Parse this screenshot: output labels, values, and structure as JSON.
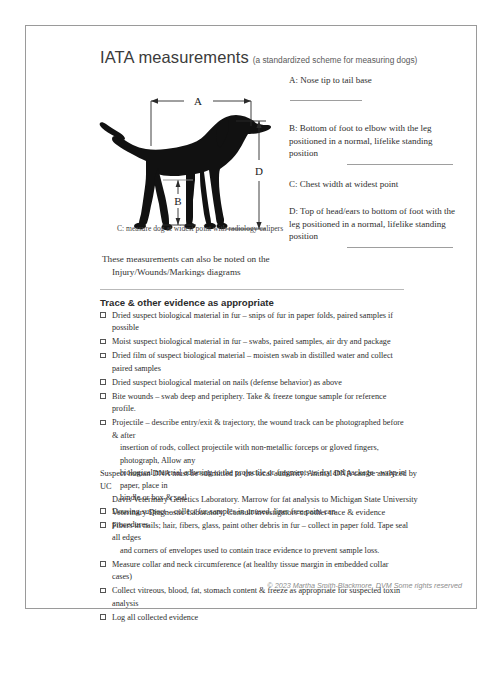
{
  "header": {
    "title": "IATA measurements",
    "subtitle": "(a standardized scheme for measuring dogs)"
  },
  "diagram": {
    "label_a": "A",
    "label_b": "B",
    "label_d": "D",
    "caption": "C: measure dog at widest point with radiology calipers",
    "note_line1": "These measurements can also be noted on the",
    "note_line2": "Injury/Wounds/Markings diagrams"
  },
  "measurements": [
    {
      "id": "A",
      "text": "A: Nose tip to tail base",
      "rule": "inline"
    },
    {
      "id": "B",
      "text": "B: Bottom of foot to elbow with the leg positioned in a normal, lifelike standing position",
      "rule": "below"
    },
    {
      "id": "C",
      "text": "C:  Chest width at widest point",
      "rule": "none"
    },
    {
      "id": "D",
      "text": "D: Top of head/ears to bottom of foot with the leg positioned in a normal, lifelike standing position",
      "rule": "below"
    }
  ],
  "trace": {
    "heading": "Trace & other evidence as appropriate",
    "items": [
      {
        "lines": [
          "Dried suspect biological material in fur – snips of fur in paper folds, paired samples if possible"
        ]
      },
      {
        "lines": [
          "Moist suspect biological material in fur – swabs, paired samples, air dry and package"
        ]
      },
      {
        "lines": [
          "Dried film of suspect biological material – moisten swab in distilled water and collect paired samples"
        ]
      },
      {
        "lines": [
          "Dried suspect biological material on nails (defense behavior) as above"
        ]
      },
      {
        "lines": [
          "Bite wounds – swab deep and periphery. Take & freeze tongue sample for reference profile."
        ]
      },
      {
        "lines": [
          "Projectile – describe entry/exit & trajectory, the wound track can be photographed before & after",
          "insertion of rods, collect projectile with non-metallic forceps or gloved fingers, photograph, Allow any",
          "biological material adhering to the projectile or fragments to dry and package - wrap in paper, place in",
          "bindle or box & seal"
        ]
      },
      {
        "lines": [
          "Dousing suspect – collect fur samples in unused, liner free paint can"
        ]
      },
      {
        "lines": [
          "Fibers in nails; hair, fibers, glass, paint other debris in fur – collect in paper fold. Tape seal all edges",
          "and corners of envelopes used to contain trace evidence to prevent sample loss."
        ]
      },
      {
        "lines": [
          "Measure collar and neck circumference (at healthy tissue margin in embedded collar cases)"
        ]
      },
      {
        "lines": [
          "Collect vitreous, blood, fat, stomach content & freeze as appropriate for suspected toxin analysis"
        ]
      },
      {
        "lines": [
          "Log all collected evidence"
        ]
      }
    ]
  },
  "closing": {
    "line1": "Suspect human DNA must be submitted to the local authority. Animal DNA can be analyzed by UC",
    "line2": "Davis Veterinary Genetics Laboratory. Marrow for fat analysis to Michigan State University",
    "line3": "Veterinary Diagnostic Laboratory. Consult investigators on other trace & evidence procedures."
  },
  "footer": {
    "copyright": "© 2023 Martha Smith-Blackmore, DVM Some rights reserved"
  },
  "colors": {
    "page_border": "#9a9a9a",
    "rule": "#9e9e9e",
    "text": "#2e2e2e",
    "footer_text": "#8d8d8d",
    "silhouette": "#111111"
  }
}
